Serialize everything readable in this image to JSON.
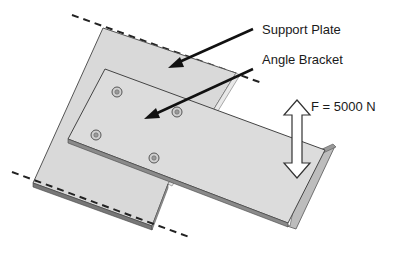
{
  "diagram": {
    "labels": {
      "support_plate": "Support Plate",
      "angle_bracket": "Angle Bracket",
      "force": "F = 5000 N"
    },
    "force_value_n": 5000,
    "holes_count": 4,
    "colors": {
      "plate_fill": "#d9d9d9",
      "plate_edge": "#555555",
      "bracket_fill": "#dcdcdc",
      "flange_fill": "#bdbdbd",
      "leader": "#111111",
      "dashed": "#222222",
      "force_arrow_fill": "#ffffff",
      "force_arrow_stroke": "#333333"
    }
  }
}
